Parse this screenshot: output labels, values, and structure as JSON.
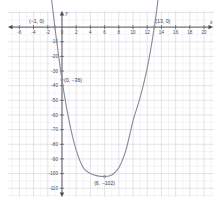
{
  "chart_data": {
    "type": "line",
    "title": "",
    "xlabel": "x",
    "ylabel": "y",
    "xlim": [
      -7.6,
      21.4
    ],
    "ylim": [
      -116,
      11
    ],
    "grid": true,
    "minor_grid": true,
    "legend": "none",
    "curve": {
      "name": "parabola",
      "equation_form": "quadratic",
      "color": "#8a8a96",
      "vertex": [
        6,
        -102
      ],
      "x_intercepts": [
        -1,
        13
      ],
      "y_intercept": [
        0,
        -36
      ],
      "opens": "up",
      "points": [
        [
          -1.6,
          25.0
        ],
        [
          -1.0,
          0.0
        ],
        [
          0.0,
          -36.0
        ],
        [
          1.0,
          -64.0
        ],
        [
          2.0,
          -84.0
        ],
        [
          3.0,
          -96.0
        ],
        [
          4.0,
          -100.0
        ],
        [
          5.0,
          -101.6
        ],
        [
          6.0,
          -102.0
        ],
        [
          7.0,
          -101.0
        ],
        [
          8.0,
          -96.0
        ],
        [
          9.0,
          -84.0
        ],
        [
          10.0,
          -64.0
        ],
        [
          11.0,
          -48.0
        ],
        [
          12.0,
          -28.0
        ],
        [
          13.0,
          0.0
        ],
        [
          13.6,
          22.0
        ]
      ]
    },
    "xticks": [
      -6,
      -4,
      -2,
      0,
      2,
      4,
      6,
      8,
      10,
      12,
      14,
      16,
      18,
      20
    ],
    "xtick_labels": [
      "-6",
      "-4",
      "-2",
      "0",
      "2",
      "4",
      "6",
      "8",
      "10",
      "12",
      "14",
      "16",
      "18",
      "20"
    ],
    "yticks": [
      -10,
      -20,
      -30,
      -40,
      -50,
      -60,
      -70,
      -80,
      -90,
      -100,
      -110
    ],
    "ytick_labels": [
      "-10",
      "-20",
      "-30",
      "-40",
      "-50",
      "-60",
      "-70",
      "-80",
      "-90",
      "-100",
      "-110"
    ],
    "annotations": [
      {
        "id": "left-root",
        "text": "(−1, 0)",
        "x": -1,
        "y": 0
      },
      {
        "id": "right-root",
        "text": "(13, 0)",
        "x": 13,
        "y": 0
      },
      {
        "id": "y-int",
        "text": "(0, −36)",
        "x": 0,
        "y": -36
      },
      {
        "id": "vertex",
        "text": "(6, −102)",
        "x": 6,
        "y": -102
      }
    ],
    "colors": {
      "background": "#ffffff",
      "minor_grid": "#e2e2ea",
      "major_grid": "#c9c9d4",
      "axis": "#4a4a52",
      "curve": "#8a8a96",
      "text": "#3a3a3a"
    }
  },
  "axis_labels": {
    "x": "x",
    "y": "y"
  }
}
